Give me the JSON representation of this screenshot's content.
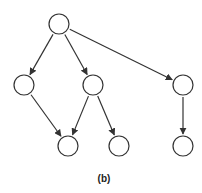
{
  "diagram": {
    "caption": "(b)",
    "type": "directed-tree",
    "stroke_color": "#333333",
    "node_radius": 10,
    "nodes": [
      {
        "id": "root",
        "x": 59,
        "y": 24
      },
      {
        "id": "left",
        "x": 24,
        "y": 85
      },
      {
        "id": "middle",
        "x": 93,
        "y": 85
      },
      {
        "id": "right",
        "x": 183,
        "y": 85
      },
      {
        "id": "bottom-1",
        "x": 68,
        "y": 146
      },
      {
        "id": "bottom-2",
        "x": 119,
        "y": 146
      },
      {
        "id": "bottom-3",
        "x": 183,
        "y": 146
      }
    ],
    "edges": [
      {
        "from": "root",
        "to": "left"
      },
      {
        "from": "root",
        "to": "middle"
      },
      {
        "from": "root",
        "to": "right"
      },
      {
        "from": "left",
        "to": "bottom-1"
      },
      {
        "from": "middle",
        "to": "bottom-1"
      },
      {
        "from": "middle",
        "to": "bottom-2"
      },
      {
        "from": "right",
        "to": "bottom-3"
      }
    ]
  }
}
